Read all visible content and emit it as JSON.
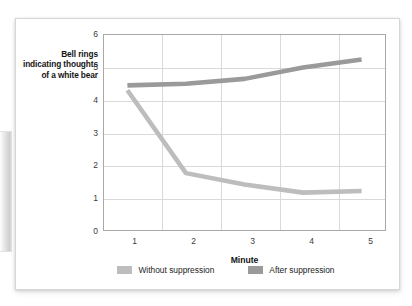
{
  "chart_data": {
    "type": "line",
    "title": "",
    "xlabel": "Minute",
    "ylabel": "Bell rings indicating thoughts of a white bear",
    "x": [
      1,
      2,
      3,
      4,
      5
    ],
    "xticklabels": [
      "1",
      "2",
      "3",
      "4",
      "5"
    ],
    "yticklabels": [
      "0",
      "1",
      "2",
      "3",
      "4",
      "5",
      "6"
    ],
    "xlim": [
      0.6,
      5.4
    ],
    "ylim": [
      0,
      6
    ],
    "grid": "both",
    "legend_position": "below",
    "series": [
      {
        "name": "Without suppression",
        "color": "#bdbdbd",
        "values": [
          4.3,
          1.75,
          1.4,
          1.15,
          1.2
        ]
      },
      {
        "name": "After suppression",
        "color": "#9a9a9a",
        "values": [
          4.45,
          4.5,
          4.65,
          5.0,
          5.25
        ]
      }
    ]
  },
  "axes": {
    "y_title": "Bell rings indicating thoughts of a white bear",
    "x_title": "Minute",
    "y_ticks": [
      "6",
      "5",
      "4",
      "3",
      "2",
      "1",
      "0"
    ],
    "x_ticks": [
      "1",
      "2",
      "3",
      "4",
      "5"
    ]
  },
  "legend": {
    "items": [
      {
        "label": "Without suppression",
        "color": "#bdbdbd"
      },
      {
        "label": "After suppression",
        "color": "#9a9a9a"
      }
    ]
  },
  "colors": {
    "grid": "#d9d9d9",
    "frame": "#a9a9a9",
    "text": "#141414",
    "tick_text": "#3a3a3a",
    "card_background": "#ffffff"
  }
}
